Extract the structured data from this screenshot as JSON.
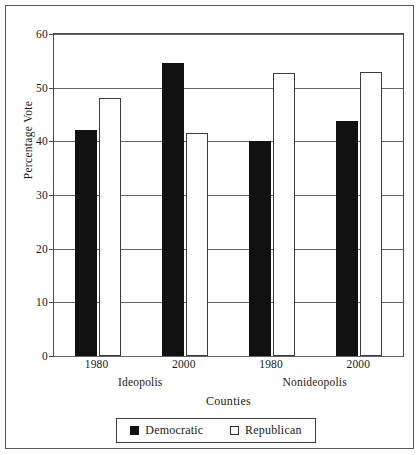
{
  "figure": {
    "background_color": "#ffffff",
    "frame_color": "#5b5b5b"
  },
  "chart_data": {
    "type": "bar",
    "title": "",
    "xlabel": "Counties",
    "ylabel": "Percentage Vote",
    "ylim": [
      0,
      60
    ],
    "yticks": [
      0,
      10,
      20,
      30,
      40,
      50,
      60
    ],
    "ytick_labels": [
      "0",
      "10",
      "20",
      "30",
      "40",
      "50",
      "60"
    ],
    "grid": true,
    "grid_axis": "y",
    "legend_position": "bottom",
    "groups": [
      {
        "name": "Ideopolis",
        "categories": [
          "1980",
          "2000"
        ]
      },
      {
        "name": "Nonideopolis",
        "categories": [
          "1980",
          "2000"
        ]
      }
    ],
    "categories": [
      "Ideopolis 1980",
      "Ideopolis 2000",
      "Nonideopolis 1980",
      "Nonideopolis 2000"
    ],
    "series": [
      {
        "name": "Democratic",
        "color": "#111111",
        "fill": "solid",
        "values": [
          42.1,
          54.6,
          40.0,
          43.8
        ]
      },
      {
        "name": "Republican",
        "color": "#ffffff",
        "fill": "open",
        "values": [
          48.0,
          41.5,
          52.8,
          52.9
        ]
      }
    ]
  },
  "axes": {
    "y_title": "Percentage Vote",
    "x_title": "Counties",
    "y_ticks": [
      {
        "value": 60,
        "label": "60"
      },
      {
        "value": 50,
        "label": "50"
      },
      {
        "value": 40,
        "label": "40"
      },
      {
        "value": 30,
        "label": "30"
      },
      {
        "value": 20,
        "label": "20"
      },
      {
        "value": 10,
        "label": "10"
      },
      {
        "value": 0,
        "label": "0"
      }
    ],
    "x_groups": [
      {
        "label": "Ideopolis",
        "years": [
          "1980",
          "2000"
        ]
      },
      {
        "label": "Nonideopolis",
        "years": [
          "1980",
          "2000"
        ]
      }
    ]
  },
  "legend": {
    "entries": [
      {
        "label": "Democratic",
        "swatch": "filled-black-square"
      },
      {
        "label": "Republican",
        "swatch": "open-white-square"
      }
    ]
  }
}
